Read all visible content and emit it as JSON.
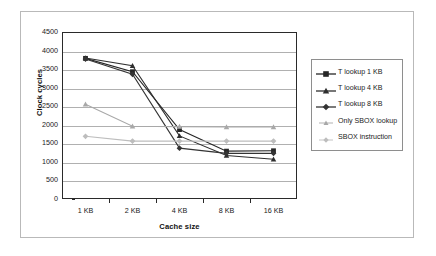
{
  "chart_data": {
    "type": "line",
    "title": "",
    "xlabel": "Cache size",
    "ylabel": "Clock cycles",
    "categories": [
      "1 KB",
      "2 KB",
      "4 KB",
      "8 KB",
      "16 KB"
    ],
    "yticks": [
      0,
      500,
      1000,
      1500,
      2000,
      2500,
      3000,
      3500,
      4000,
      4500
    ],
    "ylim": [
      0,
      4500
    ],
    "grid": "horizontal",
    "legend_position": "right",
    "series": [
      {
        "name": "T lookup 1 KB",
        "marker": "square",
        "color": "#262626",
        "values": [
          3790,
          3430,
          1870,
          1290,
          1300
        ]
      },
      {
        "name": "T lookup 4 KB",
        "marker": "triangle",
        "color": "#2e2e2e",
        "values": [
          3800,
          3590,
          1700,
          1170,
          1070
        ]
      },
      {
        "name": "T lookup 8 KB",
        "marker": "diamond",
        "color": "#343434",
        "values": [
          3770,
          3360,
          1370,
          1230,
          1230
        ]
      },
      {
        "name": "Only SBOX lookup",
        "marker": "triangle",
        "color": "#a8a8a8",
        "values": [
          2550,
          1960,
          1950,
          1940,
          1940
        ]
      },
      {
        "name": "SBOX instruction",
        "marker": "diamond",
        "color": "#bdbdbd",
        "values": [
          1690,
          1560,
          1560,
          1560,
          1560
        ]
      }
    ]
  },
  "colors": {
    "axis": "#2a2a2a",
    "gridline": "#b0b0b0",
    "frame": "#b9b9b9",
    "legend_border": "#8e8e8e",
    "background": "#ffffff"
  }
}
